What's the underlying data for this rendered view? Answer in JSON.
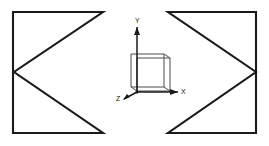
{
  "figure": {
    "canvas": {
      "width": 269,
      "height": 146,
      "background": "#ffffff"
    },
    "line_color": "#1a1a1a",
    "cube_color": "#4a4a4a",
    "shapes": [
      {
        "name": "left-arrowhead-shape",
        "points": "13,12 103,12 14,72 103,133 13,133 13,12"
      },
      {
        "name": "right-arrowhead-shape",
        "points": "256,12 168,12 256,72 168,133 256,133 256,12"
      }
    ],
    "axes": {
      "origin_x": 137,
      "origin_y": 92,
      "x_axis": {
        "label": "X",
        "label_x": 184,
        "label_y": 94,
        "line_x2": 178,
        "head": "178,92 170,89 170,95"
      },
      "y_axis": {
        "label": "Y",
        "label_x": 135,
        "label_y": 23,
        "line_y2": 27,
        "head": "137,27 134,35 140,35"
      },
      "z_axis": {
        "label": "Z",
        "label_x": 118,
        "label_y": 99,
        "line_x2": 124,
        "line_y2": 99,
        "head": "123,100 130,97 127,94"
      }
    },
    "cube": {
      "name": "reference-cube",
      "front_face": "137,91 137,58 170,58 170,91 137,91",
      "top_back_edge": "131,54 164,54 170,58",
      "left_back_edge": "131,54 131,87 137,91",
      "bottom_back_edge": "131,87 164,87 170,91",
      "back_right_edge": "164,54 164,87",
      "top_left_connector": "131,54 137,58"
    }
  }
}
